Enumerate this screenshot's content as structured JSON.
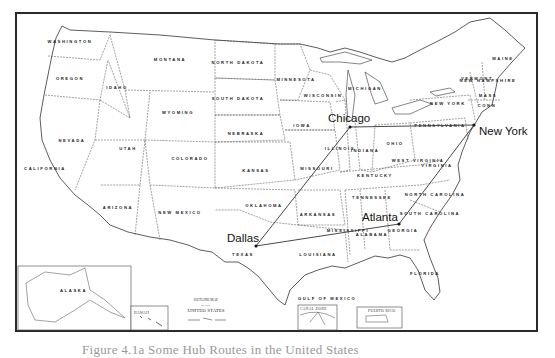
{
  "map": {
    "title_line1": "OUTLINE MAP",
    "title_line2": "OF THE",
    "title_line3": "UNITED STATES",
    "insets": {
      "alaska": "ALASKA",
      "hawaii": "HAWAII",
      "canal_zone": "CANAL ZONE",
      "puerto_rico": "PUERTO RICO"
    },
    "gulf_label": "GULF OF MEXICO",
    "states": [
      {
        "name": "WASHINGTON",
        "x": 70,
        "y": 43
      },
      {
        "name": "OREGON",
        "x": 70,
        "y": 80
      },
      {
        "name": "CALIFORNIA",
        "x": 45,
        "y": 170
      },
      {
        "name": "NEVADA",
        "x": 72,
        "y": 142
      },
      {
        "name": "IDAHO",
        "x": 117,
        "y": 89
      },
      {
        "name": "MONTANA",
        "x": 170,
        "y": 61
      },
      {
        "name": "WYOMING",
        "x": 178,
        "y": 114
      },
      {
        "name": "UTAH",
        "x": 128,
        "y": 150
      },
      {
        "name": "ARIZONA",
        "x": 118,
        "y": 209
      },
      {
        "name": "COLORADO",
        "x": 190,
        "y": 160
      },
      {
        "name": "NEW MEXICO",
        "x": 180,
        "y": 214
      },
      {
        "name": "NORTH DAKOTA",
        "x": 238,
        "y": 64
      },
      {
        "name": "SOUTH DAKOTA",
        "x": 238,
        "y": 100
      },
      {
        "name": "NEBRASKA",
        "x": 246,
        "y": 135
      },
      {
        "name": "KANSAS",
        "x": 256,
        "y": 172
      },
      {
        "name": "OKLAHOMA",
        "x": 264,
        "y": 207
      },
      {
        "name": "TEXAS",
        "x": 243,
        "y": 256
      },
      {
        "name": "MINNESOTA",
        "x": 296,
        "y": 81
      },
      {
        "name": "IOWA",
        "x": 302,
        "y": 127
      },
      {
        "name": "MISSOURI",
        "x": 317,
        "y": 170
      },
      {
        "name": "ARKANSAS",
        "x": 318,
        "y": 216
      },
      {
        "name": "LOUISIANA",
        "x": 318,
        "y": 256
      },
      {
        "name": "WISCONSIN",
        "x": 323,
        "y": 97
      },
      {
        "name": "ILLINOIS",
        "x": 340,
        "y": 150
      },
      {
        "name": "MICHIGAN",
        "x": 365,
        "y": 90
      },
      {
        "name": "INDIANA",
        "x": 365,
        "y": 152
      },
      {
        "name": "OHIO",
        "x": 395,
        "y": 145
      },
      {
        "name": "KENTUCKY",
        "x": 375,
        "y": 177
      },
      {
        "name": "TENNESSEE",
        "x": 372,
        "y": 199
      },
      {
        "name": "MISSISSIPPI",
        "x": 348,
        "y": 232
      },
      {
        "name": "ALABAMA",
        "x": 372,
        "y": 236
      },
      {
        "name": "GEORGIA",
        "x": 403,
        "y": 232
      },
      {
        "name": "FLORIDA",
        "x": 425,
        "y": 275
      },
      {
        "name": "SOUTH CAROLINA",
        "x": 430,
        "y": 215
      },
      {
        "name": "NORTH CAROLINA",
        "x": 435,
        "y": 196
      },
      {
        "name": "VIRGINIA",
        "x": 437,
        "y": 167
      },
      {
        "name": "WEST VIRGINIA",
        "x": 418,
        "y": 162
      },
      {
        "name": "PENNSYLVANIA",
        "x": 440,
        "y": 127
      },
      {
        "name": "NEW YORK",
        "x": 448,
        "y": 105
      },
      {
        "name": "MAINE",
        "x": 503,
        "y": 60
      },
      {
        "name": "VERMONT",
        "x": 477,
        "y": 80
      },
      {
        "name": "NEW HAMPSHIRE",
        "x": 488,
        "y": 82
      },
      {
        "name": "MASS",
        "x": 488,
        "y": 97
      },
      {
        "name": "CONN",
        "x": 487,
        "y": 107
      }
    ],
    "cities": [
      {
        "name": "Chicago",
        "dot_x": 350,
        "dot_y": 127,
        "label_x": 328,
        "label_y": 122
      },
      {
        "name": "New York",
        "dot_x": 474,
        "dot_y": 125,
        "label_x": 479,
        "label_y": 135
      },
      {
        "name": "Atlanta",
        "dot_x": 399,
        "dot_y": 224,
        "label_x": 362,
        "label_y": 221
      },
      {
        "name": "Dallas",
        "dot_x": 256,
        "dot_y": 246,
        "label_x": 227,
        "label_y": 242
      }
    ],
    "routes": [
      {
        "from": "Dallas",
        "to": "Chicago"
      },
      {
        "from": "Dallas",
        "to": "Atlanta"
      },
      {
        "from": "Chicago",
        "to": "New York"
      },
      {
        "from": "Atlanta",
        "to": "New York"
      }
    ],
    "line_color": "#333333",
    "border_color": "#2a2a2a"
  },
  "caption": {
    "text": "Figure 4.1a  Some Hub Routes in the United States"
  }
}
